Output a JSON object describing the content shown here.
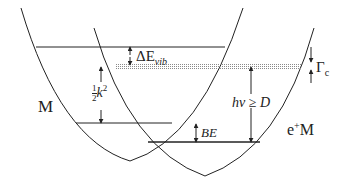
{
  "diagram": {
    "type": "potential-energy-curves",
    "curves": [
      {
        "id": "M",
        "label": "M"
      },
      {
        "id": "eM",
        "label_prefix": "e",
        "label_sup": "+",
        "label_suffix": "M"
      }
    ],
    "levels": {
      "upper_vibrational": "top solid line",
      "continuum_band": "dotted band",
      "M_ground": "M lower solid line",
      "eM_bound": "e+M lower solid line",
      "M_short": "short level between"
    },
    "annotations": {
      "delta_e_vib": {
        "sym": "ΔE",
        "sub": "vib"
      },
      "gamma_c": {
        "sym": "Γ",
        "sub": "c"
      },
      "half_k2": {
        "num": "1",
        "den": "2",
        "var": "k",
        "sup": "2"
      },
      "hv_ge_D": "hν ≥ D",
      "be": "BE"
    },
    "colors": {
      "line": "#222222",
      "dots": "#888888",
      "background": "#ffffff"
    }
  }
}
